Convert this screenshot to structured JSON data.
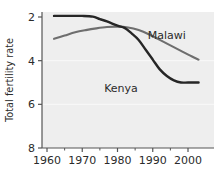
{
  "chart_data": {
    "type": "line",
    "title": "",
    "xlabel": "",
    "ylabel": "Total fertility rate",
    "xlim": [
      1960,
      2005
    ],
    "ylim": [
      2,
      8
    ],
    "grid": true,
    "grid_note": "faint horizontal gridlines at 4 and 6",
    "legend_position": "inline-annotations",
    "x_ticks": [
      1960,
      1970,
      1980,
      1990,
      2000
    ],
    "x_minor_ticks": [
      1965,
      1975,
      1985,
      1995
    ],
    "y_ticks": [
      2,
      4,
      6,
      8
    ],
    "plot_background": "#eeeeee",
    "series": [
      {
        "name": "Kenya",
        "color": "#262626",
        "label_x": 1981,
        "label_y": 4.55,
        "x": [
          1962,
          1965,
          1970,
          1973,
          1975,
          1977,
          1980,
          1982,
          1984,
          1986,
          1988,
          1990,
          1992,
          1994,
          1996,
          1998,
          2000,
          2003
        ],
        "values": [
          8.05,
          8.05,
          8.05,
          8.02,
          7.9,
          7.8,
          7.6,
          7.5,
          7.25,
          6.95,
          6.5,
          6.05,
          5.6,
          5.3,
          5.1,
          5.0,
          5.0,
          5.0
        ]
      },
      {
        "name": "Malawi",
        "color": "#6e6e6e",
        "label_x": 1994,
        "label_y": 7.0,
        "x": [
          1962,
          1965,
          1968,
          1971,
          1974,
          1977,
          1980,
          1983,
          1986,
          1989,
          1992,
          1995,
          1998,
          2001,
          2003
        ],
        "values": [
          7.0,
          7.15,
          7.3,
          7.4,
          7.48,
          7.54,
          7.56,
          7.52,
          7.4,
          7.2,
          6.95,
          6.7,
          6.45,
          6.2,
          6.05
        ]
      }
    ]
  },
  "axis": {
    "y_tick_labels": [
      "8",
      "6",
      "4",
      "2"
    ],
    "x_tick_labels": [
      "1960",
      "1970",
      "1980",
      "1990",
      "2000"
    ],
    "y_axis_title": "Total fertility rate"
  },
  "annotations": {
    "malawi": "Malawi",
    "kenya": "Kenya"
  },
  "colors": {
    "kenya_line": "#262626",
    "malawi_line": "#6e6e6e",
    "axis": "#555555",
    "plot_bg": "#eeeeee",
    "gridline": "#f7f7f7",
    "text": "#2b2b2b"
  }
}
